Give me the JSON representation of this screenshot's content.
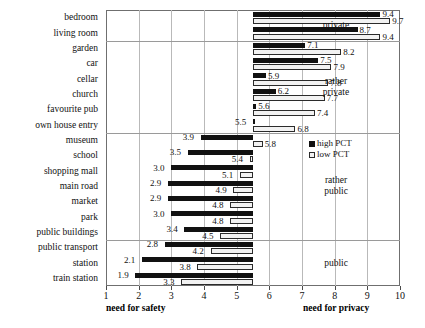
{
  "chart_data": {
    "type": "bar",
    "title": "",
    "subtitle": "",
    "orientation": "horizontal-diverging",
    "baseline": 5.5,
    "xlabel_left": "need for safety",
    "xlabel_right": "need for privacy",
    "ylabel": "",
    "xlim": [
      1,
      10
    ],
    "xticks": [
      1,
      2,
      3,
      4,
      5,
      6,
      7,
      8,
      9,
      10
    ],
    "xticklabels": [
      "1",
      "2",
      "3",
      "4",
      "5",
      "6",
      "7",
      "8",
      "9",
      "10"
    ],
    "grid": "vertical",
    "legend_position": "center-right",
    "legend": [
      "high PCT",
      "low PCT"
    ],
    "categories": [
      "bedroom",
      "living room",
      "garden",
      "car",
      "cellar",
      "church",
      "favourite pub",
      "own house entry",
      "museum",
      "school",
      "shopping mall",
      "main road",
      "market",
      "park",
      "public buildings",
      "public transport",
      "station",
      "train station"
    ],
    "series": [
      {
        "name": "high PCT",
        "color": "#111111",
        "values": [
          9.4,
          8.7,
          7.1,
          7.5,
          5.9,
          6.2,
          5.6,
          5.5,
          3.9,
          3.5,
          3.0,
          2.9,
          2.9,
          3.0,
          3.4,
          2.8,
          2.1,
          1.9
        ]
      },
      {
        "name": "low PCT",
        "color": "#f2f2f2",
        "values": [
          9.7,
          9.4,
          8.2,
          7.9,
          7.8,
          7.7,
          7.4,
          6.8,
          5.8,
          5.4,
          5.1,
          4.9,
          4.8,
          4.8,
          4.5,
          4.2,
          3.8,
          3.3
        ]
      }
    ],
    "zones": [
      {
        "label": "private",
        "from_index": 0,
        "to_index": 1
      },
      {
        "label": "rather\nprivate",
        "from_index": 2,
        "to_index": 7
      },
      {
        "label": "rather\npublic",
        "from_index": 8,
        "to_index": 14
      },
      {
        "label": "public",
        "from_index": 15,
        "to_index": 17
      }
    ],
    "value_labels": {
      "high": [
        "9.4",
        "8.7",
        "7.1",
        "7.5",
        "5.9",
        "6.2",
        "5.6",
        "5.5",
        "3.9",
        "3.5",
        "3.0",
        "2.9",
        "2.9",
        "3.0",
        "3.4",
        "2.8",
        "2.1",
        "1.9"
      ],
      "low": [
        "9.7",
        "9.4",
        "8.2",
        "7.9",
        "7.8",
        "7.7",
        "7.4",
        "6.8",
        "5.8",
        "5.4",
        "5.1",
        "4.9",
        "4.8",
        "4.8",
        "4.5",
        "4.2",
        "3.8",
        "3.3"
      ]
    }
  }
}
